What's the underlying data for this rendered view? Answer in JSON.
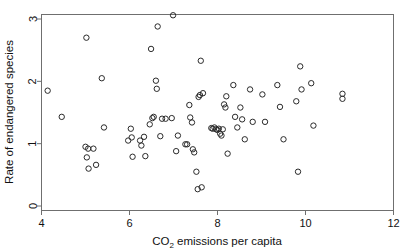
{
  "chart_data": {
    "type": "scatter",
    "title": "",
    "xlabel": "CO2 emissions per capita",
    "xlabel_parts": {
      "pre": "CO",
      "sub": "2",
      "post": " emissions per capita"
    },
    "ylabel": "Rate of endangered species",
    "xlim": [
      4,
      12
    ],
    "ylim": [
      0,
      3.15
    ],
    "xticks": [
      4,
      6,
      8,
      10,
      12
    ],
    "xticklabels": [
      "4",
      "6",
      "8",
      "10",
      "12"
    ],
    "yticks": [
      0,
      1,
      2,
      3
    ],
    "yticklabels": [
      "0",
      "1",
      "2",
      "3"
    ],
    "grid": false,
    "legend": null,
    "marker": "open-circle",
    "marker_color": "#2a2a2a",
    "frame_color": "#6f6f6f",
    "background": "#ffffff",
    "n_points": 96,
    "points": [
      [
        4.14,
        1.85
      ],
      [
        4.46,
        1.43
      ],
      [
        5.02,
        2.7
      ],
      [
        5.0,
        0.95
      ],
      [
        5.06,
        0.92
      ],
      [
        5.03,
        0.78
      ],
      [
        5.07,
        0.6
      ],
      [
        5.18,
        0.92
      ],
      [
        5.24,
        0.66
      ],
      [
        5.37,
        2.05
      ],
      [
        5.42,
        1.26
      ],
      [
        5.97,
        1.05
      ],
      [
        6.03,
        1.24
      ],
      [
        6.05,
        1.1
      ],
      [
        6.07,
        0.79
      ],
      [
        6.24,
        1.05
      ],
      [
        6.27,
        0.97
      ],
      [
        6.33,
        1.11
      ],
      [
        6.36,
        0.8
      ],
      [
        6.46,
        1.31
      ],
      [
        6.49,
        2.52
      ],
      [
        6.52,
        1.41
      ],
      [
        6.55,
        1.43
      ],
      [
        6.6,
        2.01
      ],
      [
        6.62,
        1.88
      ],
      [
        6.64,
        2.88
      ],
      [
        6.7,
        1.12
      ],
      [
        6.74,
        1.4
      ],
      [
        6.82,
        1.4
      ],
      [
        6.96,
        1.41
      ],
      [
        6.99,
        3.06
      ],
      [
        7.06,
        0.88
      ],
      [
        7.1,
        1.13
      ],
      [
        7.27,
        0.99
      ],
      [
        7.31,
        0.99
      ],
      [
        7.36,
        1.62
      ],
      [
        7.38,
        1.42
      ],
      [
        7.42,
        1.34
      ],
      [
        7.44,
        0.91
      ],
      [
        7.47,
        0.86
      ],
      [
        7.52,
        0.55
      ],
      [
        7.55,
        0.27
      ],
      [
        7.57,
        1.75
      ],
      [
        7.6,
        1.78
      ],
      [
        7.62,
        2.33
      ],
      [
        7.64,
        0.3
      ],
      [
        7.67,
        1.81
      ],
      [
        7.86,
        1.25
      ],
      [
        7.89,
        1.24
      ],
      [
        7.93,
        1.26
      ],
      [
        7.97,
        1.23
      ],
      [
        8.0,
        1.22
      ],
      [
        8.03,
        1.24
      ],
      [
        8.06,
        1.16
      ],
      [
        8.09,
        1.13
      ],
      [
        8.12,
        1.23
      ],
      [
        8.15,
        1.63
      ],
      [
        8.18,
        1.58
      ],
      [
        8.2,
        1.76
      ],
      [
        8.23,
        0.84
      ],
      [
        8.36,
        1.94
      ],
      [
        8.4,
        1.43
      ],
      [
        8.45,
        1.26
      ],
      [
        8.52,
        1.58
      ],
      [
        8.56,
        1.39
      ],
      [
        8.62,
        1.07
      ],
      [
        8.74,
        1.87
      ],
      [
        8.8,
        1.35
      ],
      [
        9.02,
        1.79
      ],
      [
        9.08,
        1.35
      ],
      [
        9.36,
        1.94
      ],
      [
        9.42,
        1.59
      ],
      [
        9.5,
        1.07
      ],
      [
        9.79,
        1.68
      ],
      [
        9.83,
        0.55
      ],
      [
        9.88,
        2.24
      ],
      [
        9.91,
        1.87
      ],
      [
        10.13,
        1.97
      ],
      [
        10.18,
        1.29
      ],
      [
        10.84,
        1.8
      ],
      [
        10.84,
        1.72
      ]
    ]
  }
}
